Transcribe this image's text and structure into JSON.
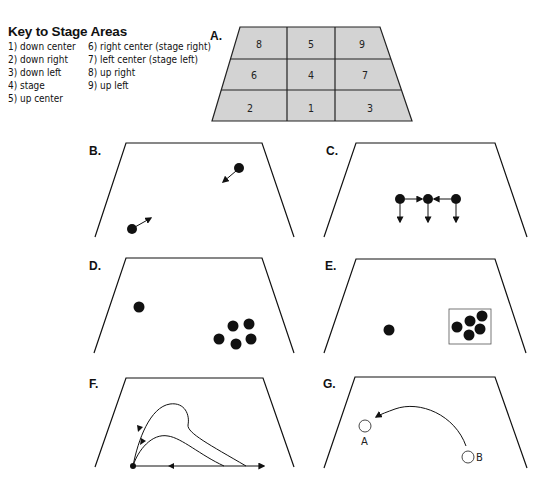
{
  "key": {
    "title": "Key to Stage Areas",
    "left_items": [
      "1) down center",
      "2) down right",
      "3) down left",
      "4) stage",
      "5) up center"
    ],
    "right_items": [
      "6) right center (stage right)",
      "7) left center (stage left)",
      "8) up right",
      "9) up left"
    ]
  },
  "panels": {
    "A": {
      "label": "A.",
      "fill": "#d3d3d3",
      "grid": [
        [
          "8",
          "5",
          "9"
        ],
        [
          "6",
          "4",
          "7"
        ],
        [
          "2",
          "1",
          "3"
        ]
      ]
    },
    "B": {
      "label": "B."
    },
    "C": {
      "label": "C."
    },
    "D": {
      "label": "D."
    },
    "E": {
      "label": "E."
    },
    "F": {
      "label": "F."
    },
    "G": {
      "label": "G.",
      "mark_a": "A",
      "mark_b": "B"
    }
  },
  "colors": {
    "line": "#111111",
    "grid_fill": "#d3d3d3"
  }
}
